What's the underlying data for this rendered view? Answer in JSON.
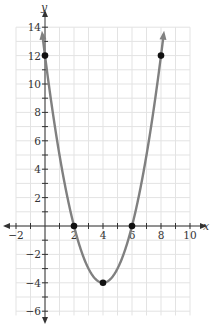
{
  "chart_data": {
    "type": "line",
    "title": "",
    "function": "y = (x - 2)(x - 6) = x^2 - 8x + 12",
    "xlabel": "x",
    "ylabel": "y",
    "xlim": [
      -2,
      10
    ],
    "ylim": [
      -6,
      14
    ],
    "grid": true,
    "grid_step": 1,
    "x_ticks": [
      -2,
      2,
      4,
      6,
      8,
      10
    ],
    "y_ticks": [
      -6,
      -4,
      -2,
      2,
      4,
      6,
      8,
      10,
      12,
      14
    ],
    "series": [
      {
        "name": "parabola",
        "color": "#808080",
        "x": [
          0,
          1,
          2,
          3,
          4,
          5,
          6,
          7,
          8
        ],
        "y": [
          12,
          5,
          0,
          -3,
          -4,
          -3,
          0,
          5,
          12
        ]
      }
    ],
    "points": [
      {
        "x": 0,
        "y": 12
      },
      {
        "x": 2,
        "y": 0
      },
      {
        "x": 4,
        "y": -4
      },
      {
        "x": 6,
        "y": 0
      },
      {
        "x": 8,
        "y": 12
      }
    ],
    "colors": {
      "grid": "#e3e3e3",
      "axis": "#333333",
      "curve": "#808080",
      "point": "#111111"
    }
  }
}
